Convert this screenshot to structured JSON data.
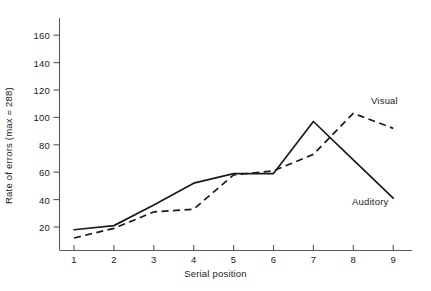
{
  "chart_data": {
    "type": "line",
    "title": "",
    "xlabel": "Serial position",
    "ylabel": "Rate of errors (max = 288)",
    "x": [
      1,
      2,
      3,
      4,
      5,
      6,
      7,
      8,
      9
    ],
    "xticklabels": [
      "1",
      "2",
      "3",
      "4",
      "5",
      "6",
      "7",
      "8",
      "9"
    ],
    "yticks": [
      20,
      40,
      60,
      80,
      100,
      120,
      140,
      160
    ],
    "yticklabels": [
      "20",
      "40",
      "60",
      "80",
      "100",
      "120",
      "140",
      "160"
    ],
    "xlim": [
      0.55,
      9.45
    ],
    "ylim": [
      0,
      172
    ],
    "grid": false,
    "legend_position": "inline-annotation",
    "series": [
      {
        "name": "Auditory",
        "style": "solid",
        "color": "#1b1b1b",
        "values": [
          18,
          21,
          36,
          52,
          59,
          59,
          97,
          69,
          41
        ],
        "annotation": "Auditory"
      },
      {
        "name": "Visual",
        "style": "dashed",
        "color": "#1b1b1b",
        "values": [
          12,
          19,
          31,
          33,
          58,
          61,
          73,
          103,
          92
        ],
        "annotation": "Visual"
      }
    ]
  },
  "axes": {
    "x_title": "Serial position",
    "y_title": "Rate of errors (max = 288)"
  },
  "annotations": {
    "visual": "Visual",
    "auditory": "Auditory"
  },
  "colors": {
    "line": "#1b1b1b",
    "axis": "#58585a",
    "background": "#ffffff"
  }
}
